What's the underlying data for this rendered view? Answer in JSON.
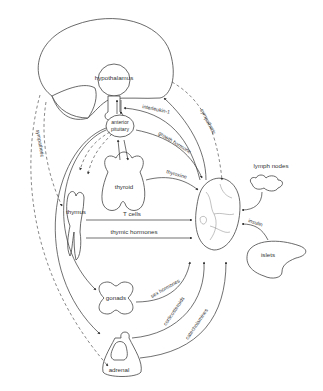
{
  "diagram": {
    "type": "neuroendocrine-immune interaction diagram",
    "organs": {
      "hypothalamus": "hypothalamus",
      "anterior_pituitary_line1": "anterior",
      "anterior_pituitary_line2": "pituitary",
      "thyroid": "thyroid",
      "thymus": "thymus",
      "gonads": "gonads",
      "adrenal": "adrenal",
      "lymph_nodes": "lymph nodes",
      "islets": "islets"
    },
    "signals": {
      "interleukin": "interleukin-1",
      "growth_hormone": "growth hormone",
      "thyroxine": "thyroxine",
      "t_cells": "T cells",
      "thymic_hormones": "thymic hormones",
      "insulin": "insulin",
      "sex_hormones": "sex hormones",
      "corticosteroids": "corticosteroids",
      "catecholamines": "catecholamines",
      "sympathetic_right": "sympathetic",
      "sympathetic_left": "sympathetic"
    },
    "center": "immune cell (macrophage)"
  }
}
